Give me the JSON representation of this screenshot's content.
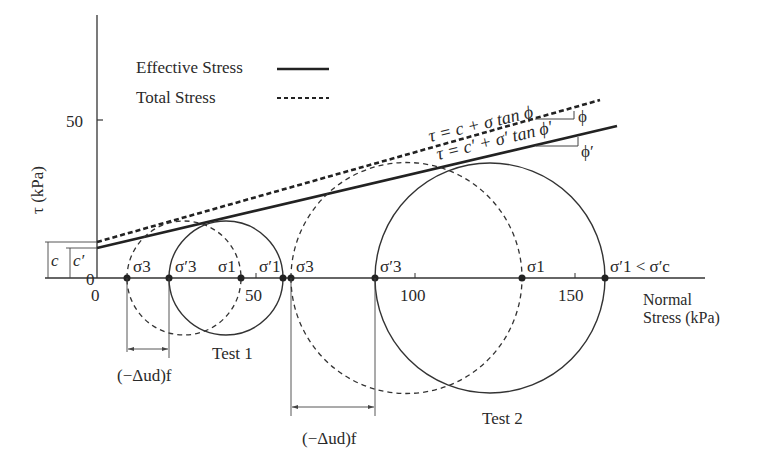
{
  "diagram": {
    "y_axis": {
      "label": "τ (kPa)",
      "ticks": [
        {
          "value": "50"
        },
        {
          "value": "0"
        }
      ]
    },
    "x_axis": {
      "label_line1": "Normal",
      "label_line2": "Stress (kPa)",
      "ticks": [
        "0",
        "50",
        "100",
        "150"
      ]
    },
    "legend": {
      "effective": "Effective Stress",
      "total": "Total Stress"
    },
    "envelopes": {
      "total_eq": "τ = c + σ tan ϕ",
      "effective_eq": "τ = c′ + σ′ tan ϕ′",
      "phi": "ϕ",
      "phi_prime": "ϕ′",
      "c": "c",
      "c_prime": "c′"
    },
    "test1": {
      "label": "Test 1",
      "points": [
        "σ3",
        "σ′3",
        "σ1",
        "σ′1"
      ],
      "pore_pressure": "(−Δud)f"
    },
    "test2": {
      "label": "Test 2",
      "points": [
        "σ3",
        "σ′3",
        "σ1",
        "σ′1 < σ′c"
      ],
      "pore_pressure": "(−Δud)f"
    },
    "colors": {
      "ink": "#2a2a2a",
      "background": "#ffffff"
    }
  }
}
